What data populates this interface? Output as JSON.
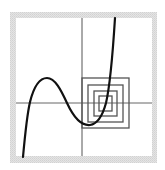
{
  "diagram": {
    "type": "cobweb-iteration-plot",
    "frame": {
      "outer": {
        "x": 10,
        "y": 12,
        "w": 147,
        "h": 151
      },
      "inner": {
        "x": 16,
        "y": 18,
        "w": 136,
        "h": 138
      },
      "border_color": "#dcdcdc",
      "background": "#ffffff"
    },
    "axes": {
      "x_axis_y": 103,
      "y_axis_x": 82,
      "color": "#555555"
    },
    "curve": {
      "description": "cubic function with local max and local min",
      "color": "#111111",
      "points": [
        [
          23,
          157
        ],
        [
          29,
          103
        ],
        [
          47,
          78
        ],
        [
          67,
          103
        ],
        [
          90,
          125
        ],
        [
          106,
          103
        ],
        [
          115,
          18
        ]
      ]
    },
    "nested_squares": [
      {
        "x": 82,
        "y": 78,
        "w": 47,
        "h": 50
      },
      {
        "x": 88,
        "y": 85,
        "w": 35,
        "h": 37
      },
      {
        "x": 94,
        "y": 91,
        "w": 23,
        "h": 25
      },
      {
        "x": 99,
        "y": 96,
        "w": 13,
        "h": 15
      }
    ],
    "square_color": "#555555"
  }
}
